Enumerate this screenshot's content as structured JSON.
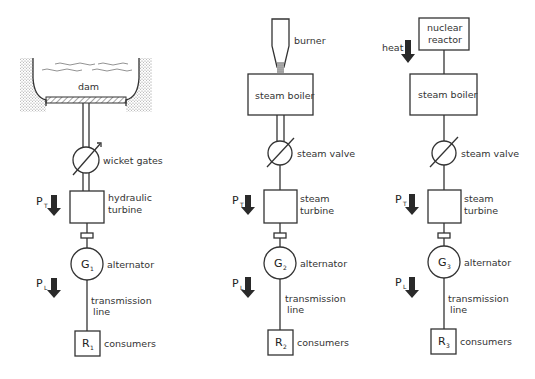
{
  "diagram": {
    "type": "power-generation-schematics",
    "columns": [
      {
        "id": "hydro",
        "source_label": "dam",
        "valve_label": "wicket gates",
        "turbine_label_line1": "hydraulic",
        "turbine_label_line2": "turbine",
        "generator_symbol": "G",
        "generator_index": "1",
        "generator_label": "alternator",
        "line_label_line1": "transmission",
        "line_label_line2": "line",
        "load_symbol": "R",
        "load_index": "1",
        "load_label": "consumers",
        "pt_symbol": "P",
        "pt_index": "T",
        "pl_symbol": "P",
        "pl_index": "L"
      },
      {
        "id": "fossil",
        "burner_label": "burner",
        "boiler_label": "steam boiler",
        "valve_label": "steam valve",
        "turbine_label_line1": "steam",
        "turbine_label_line2": "turbine",
        "generator_symbol": "G",
        "generator_index": "2",
        "generator_label": "alternator",
        "line_label_line1": "transmission",
        "line_label_line2": "line",
        "load_symbol": "R",
        "load_index": "2",
        "load_label": "consumers",
        "pt_symbol": "P",
        "pt_index": "T",
        "pl_symbol": "P",
        "pl_index": "L"
      },
      {
        "id": "nuclear",
        "reactor_label_line1": "nuclear",
        "reactor_label_line2": "reactor",
        "heat_label": "heat",
        "boiler_label": "steam boiler",
        "valve_label": "steam valve",
        "turbine_label_line1": "steam",
        "turbine_label_line2": "turbine",
        "generator_symbol": "G",
        "generator_index": "3",
        "generator_label": "alternator",
        "line_label_line1": "transmission",
        "line_label_line2": "line",
        "load_symbol": "R",
        "load_index": "3",
        "load_label": "consumers",
        "pt_symbol": "P",
        "pt_index": "T",
        "pl_symbol": "P",
        "pl_index": "L"
      }
    ]
  }
}
